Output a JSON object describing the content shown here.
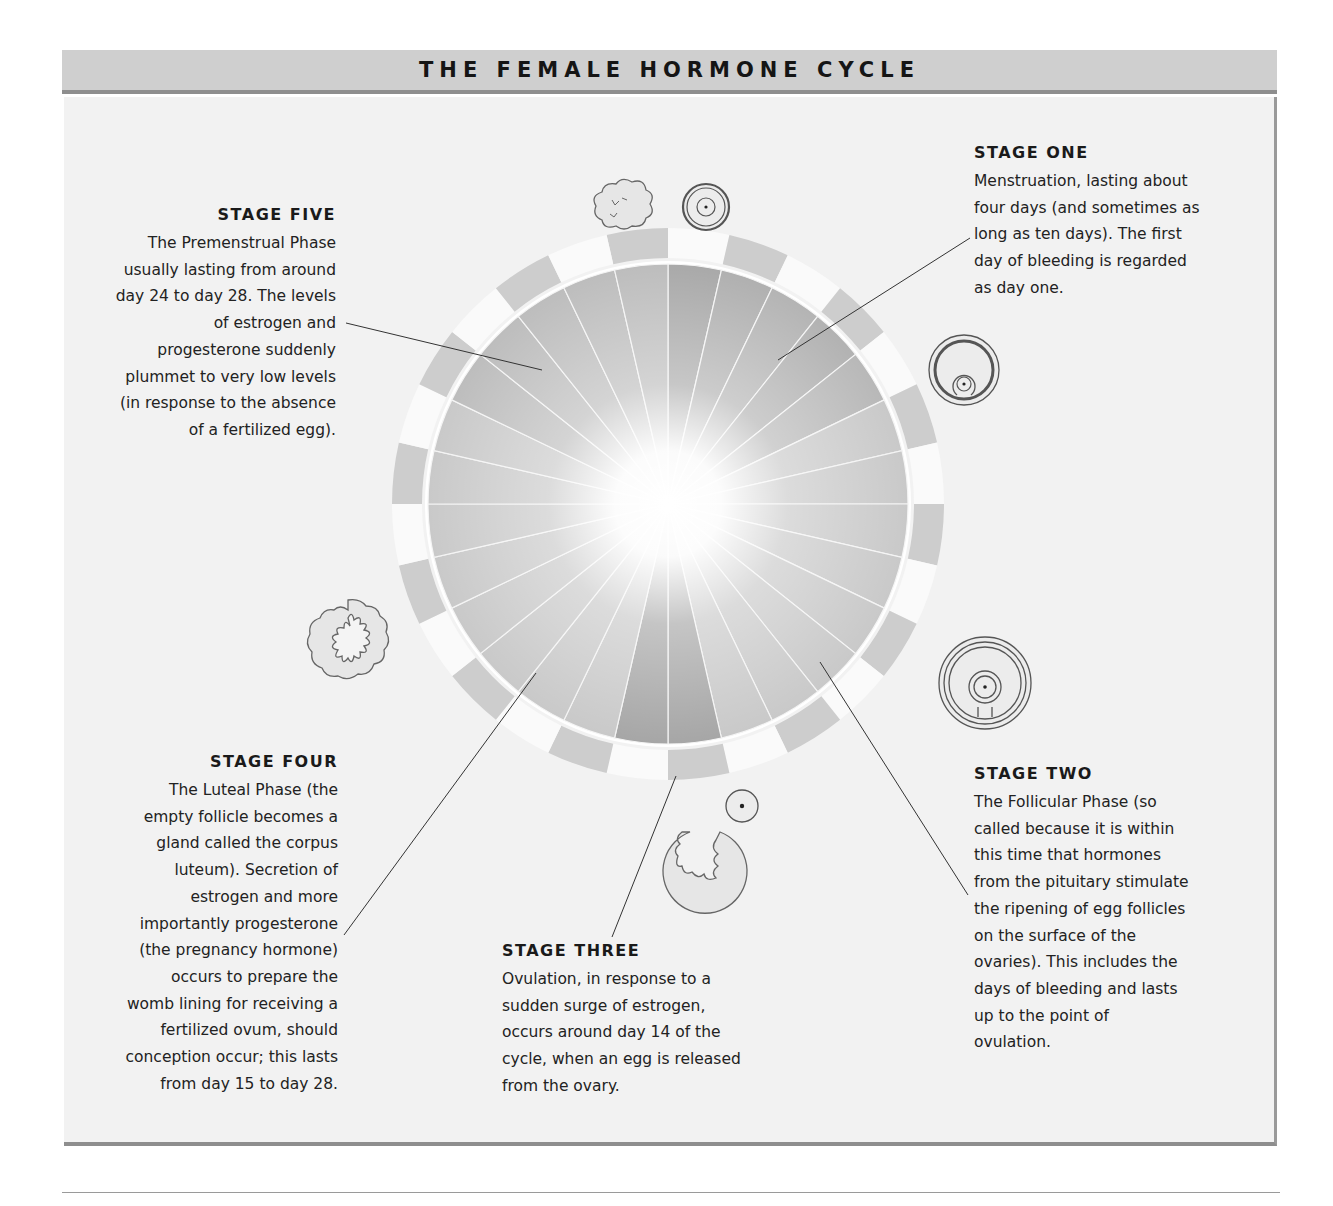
{
  "header": {
    "title": "THE FEMALE HORMONE CYCLE"
  },
  "colors": {
    "header_bg": "#cfcfcf",
    "header_border": "#8e8e8e",
    "panel_bg": "#f2f2f2",
    "ring_gray": "#cdcdcd",
    "ring_white": "#fafafa",
    "wedge_dark": "#a8a8a8",
    "wedge_light": "#c9c9c9"
  },
  "diagram": {
    "days_in_cycle": 28,
    "center": [
      668,
      504
    ],
    "inner_radius": 240,
    "ring_inner_radius": 246,
    "ring_outer_radius": 276
  },
  "stages": [
    {
      "id": "stage-one",
      "title": "STAGE ONE",
      "lines": [
        "Menstruation, lasting about",
        "four days (and sometimes as",
        "long as ten days). The first",
        "day of bleeding is regarded",
        "as day one."
      ]
    },
    {
      "id": "stage-two",
      "title": "STAGE TWO",
      "lines": [
        "The Follicular Phase (so",
        "called because it is within",
        "this time that hormones",
        "from the pituitary stimulate",
        "the ripening of egg follicles",
        "on the surface of the",
        "ovaries). This includes the",
        "days of bleeding and lasts",
        "up to the point of",
        "ovulation."
      ]
    },
    {
      "id": "stage-three",
      "title": "STAGE THREE",
      "lines": [
        "Ovulation, in response to a",
        "sudden surge of estrogen,",
        "occurs around day 14 of the",
        "cycle, when an egg is released",
        "from the ovary."
      ]
    },
    {
      "id": "stage-four",
      "title": "STAGE FOUR",
      "lines": [
        "The Luteal Phase (the",
        "empty follicle becomes a",
        "gland called the corpus",
        "luteum). Secretion of",
        "estrogen and more",
        "importantly progesterone",
        "(the pregnancy hormone)",
        "occurs to prepare the",
        "womb lining for receiving a",
        "fertilized ovum, should",
        "conception occur; this lasts",
        "from day 15 to day 28."
      ]
    },
    {
      "id": "stage-five",
      "title": "STAGE FIVE",
      "lines": [
        "The Premenstrual Phase",
        "usually lasting from around",
        "day 24 to day 28. The levels",
        "of estrogen and",
        "progesterone suddenly",
        "plummet to very low levels",
        "(in response to the absence",
        "of a fertilized egg)."
      ]
    }
  ],
  "icons": [
    {
      "name": "shed-lining-icon",
      "x": 618,
      "y": 207
    },
    {
      "name": "primary-follicle-icon",
      "x": 706,
      "y": 207
    },
    {
      "name": "developing-follicle-icon",
      "x": 964,
      "y": 370
    },
    {
      "name": "mature-follicle-icon",
      "x": 985,
      "y": 687
    },
    {
      "name": "released-egg-icon",
      "x": 741,
      "y": 807
    },
    {
      "name": "ruptured-follicle-icon",
      "x": 706,
      "y": 870
    },
    {
      "name": "corpus-luteum-icon",
      "x": 348,
      "y": 641
    }
  ]
}
